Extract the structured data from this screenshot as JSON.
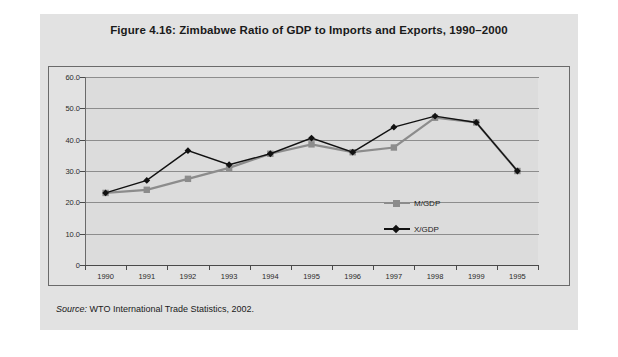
{
  "figure": {
    "title": "Figure 4.16:  Zimbabwe Ratio of GDP to Imports and Exports, 1990–2000",
    "source_label": "Source:",
    "source_text": "WTO International Trade Statistics, 2002."
  },
  "colors": {
    "panel_bg": "#e2e2e2",
    "plot_bg": "#dcdcdc",
    "grid": "#8d8d8d",
    "axis": "#4a4a4a",
    "series_m": "#8c8c8c",
    "series_x": "#111111",
    "top_rule": "#9b9b9b"
  },
  "chart_data": {
    "type": "line",
    "title": "Figure 4.16:  Zimbabwe Ratio of GDP to Imports and Exports, 1990–2000",
    "xlabel": "",
    "ylabel": "",
    "ylim": [
      0,
      60
    ],
    "yticks": [
      0,
      10,
      20,
      30,
      40,
      50,
      60
    ],
    "ytick_labels": [
      "0",
      "10.0",
      "20.0",
      "30.0",
      "40.0",
      "50.0",
      "60.0"
    ],
    "grid": true,
    "legend_position": "inside-right",
    "categories": [
      "1990",
      "1991",
      "1992",
      "1993",
      "1994",
      "1995",
      "1996",
      "1997",
      "1998",
      "1999",
      "1995"
    ],
    "series": [
      {
        "name": "M/GDP",
        "marker": "square",
        "color": "#8c8c8c",
        "values": [
          23.0,
          24.0,
          27.5,
          31.0,
          35.5,
          38.5,
          36.0,
          37.5,
          47.0,
          45.5,
          30.0
        ]
      },
      {
        "name": "X/GDP",
        "marker": "diamond",
        "color": "#111111",
        "values": [
          23.0,
          27.0,
          36.5,
          32.0,
          35.5,
          40.5,
          36.0,
          44.0,
          47.5,
          45.5,
          30.0
        ]
      }
    ]
  }
}
